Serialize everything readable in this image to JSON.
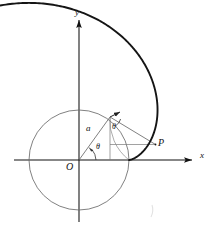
{
  "figure": {
    "background_color": "#ffffff",
    "ink_color": "#111111",
    "thin_line_color": "#6a6a6a",
    "curve_color": "#151515"
  },
  "axes": {
    "x_label": "x",
    "y_label": "y",
    "origin_label": "O",
    "x_axis": {
      "x1": 14,
      "y1": 160,
      "x2": 196,
      "y2": 160
    },
    "y_axis": {
      "x1": 79,
      "y1": 222,
      "x2": 79,
      "y2": 16
    },
    "origin": {
      "x": 79,
      "y": 160
    }
  },
  "circle": {
    "center": {
      "x": 79,
      "y": 160
    },
    "radius": 50,
    "stroke_color": "#6a6a6a"
  },
  "involute": {
    "type": "involute-of-circle",
    "a": 50,
    "start_point": {
      "x": 129,
      "y": 160
    },
    "end_point": {
      "x": 104,
      "y": 24
    },
    "theta_start_deg": 0,
    "theta_end_deg": 195,
    "stroke_color": "#151515",
    "stroke_width": 1.9
  },
  "labels": {
    "radius_label": "a",
    "angle_at_origin": "θ",
    "angle_at_tangent": "θ",
    "point_label": "P"
  },
  "points": {
    "tangent_point": {
      "x": 110,
      "y": 117,
      "theta_deg": 41
    },
    "P": {
      "x": 155.5,
      "y": 144.5
    },
    "P_label_pos": {
      "x": 158,
      "y": 138
    }
  },
  "label_positions": {
    "y": {
      "x": 75,
      "y": 12
    },
    "x": {
      "x": 201,
      "y": 155
    },
    "O": {
      "x": 67,
      "y": 163
    },
    "a": {
      "x": 87,
      "y": 126
    },
    "theta_origin": {
      "x": 95,
      "y": 145
    },
    "theta_tangent": {
      "x": 112,
      "y": 124
    }
  }
}
